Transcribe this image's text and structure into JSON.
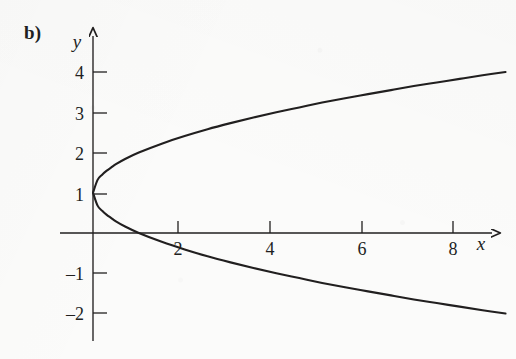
{
  "figure": {
    "panel_label": "b)",
    "ink_color": "#211f1f",
    "background_color": "#fbfbfa"
  },
  "axes": {
    "x_axis_name": "x",
    "y_axis_name": "y",
    "x_ticks": [
      {
        "label": "2",
        "value": 2
      },
      {
        "label": "4",
        "value": 4
      },
      {
        "label": "6",
        "value": 6
      },
      {
        "label": "8",
        "value": 8
      }
    ],
    "y_ticks": [
      {
        "label": "4",
        "value": 4
      },
      {
        "label": "3",
        "value": 3
      },
      {
        "label": "2",
        "value": 2
      },
      {
        "label": "1",
        "value": 1
      },
      {
        "label": "–1",
        "value": -1
      },
      {
        "label": "–2",
        "value": -2
      }
    ]
  },
  "chart_data": {
    "type": "line",
    "title": "",
    "subtitle": "",
    "xlabel": "x",
    "ylabel": "y",
    "equation": "x = (y - 1)^2,  i.e.  y = 1 ± √x",
    "xlim": [
      -0.6,
      9.6
    ],
    "ylim": [
      -2.7,
      4.8
    ],
    "grid": false,
    "legend": null,
    "legend_position": "none",
    "vertex": [
      0,
      1
    ],
    "annotations": [
      "b)"
    ],
    "series": [
      {
        "name": "upper branch: y = 1 + √x",
        "x": [
          0,
          0.1,
          0.2,
          0.3,
          0.4,
          0.5,
          0.7,
          1,
          1.5,
          2,
          2.5,
          3,
          3.5,
          4,
          4.5,
          5,
          5.5,
          6,
          6.5,
          7,
          7.5,
          8,
          8.5,
          9
        ],
        "y": [
          1,
          1.32,
          1.45,
          1.55,
          1.63,
          1.71,
          1.84,
          2,
          2.22,
          2.41,
          2.58,
          2.73,
          2.87,
          3,
          3.12,
          3.24,
          3.35,
          3.45,
          3.55,
          3.65,
          3.74,
          3.83,
          3.92,
          4
        ]
      },
      {
        "name": "lower branch: y = 1 − √x",
        "x": [
          0,
          0.1,
          0.2,
          0.3,
          0.4,
          0.5,
          0.7,
          1,
          1.5,
          2,
          2.5,
          3,
          3.5,
          4,
          4.5,
          5,
          5.5,
          6,
          6.5,
          7,
          7.5,
          8,
          8.5,
          9
        ],
        "y": [
          1,
          0.68,
          0.55,
          0.45,
          0.37,
          0.29,
          0.16,
          0,
          -0.22,
          -0.41,
          -0.58,
          -0.73,
          -0.87,
          -1,
          -1.12,
          -1.24,
          -1.35,
          -1.45,
          -1.55,
          -1.65,
          -1.74,
          -1.83,
          -1.92,
          -2
        ]
      }
    ]
  }
}
